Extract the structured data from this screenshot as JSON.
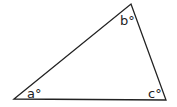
{
  "diagram": {
    "type": "triangle",
    "stroke_color": "#222222",
    "background": "#ffffff",
    "vertices": {
      "A": {
        "x": 14,
        "y": 99
      },
      "B": {
        "x": 131,
        "y": 4
      },
      "C": {
        "x": 166,
        "y": 100
      }
    },
    "angle_labels": {
      "a": "a°",
      "b": "b°",
      "c": "c°"
    }
  }
}
